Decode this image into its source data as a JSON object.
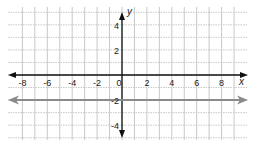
{
  "chart_data": {
    "type": "line",
    "title": "",
    "xlabel": "x",
    "ylabel": "y",
    "xlim": [
      -9,
      9
    ],
    "ylim": [
      -5,
      5
    ],
    "grid": true,
    "x_ticks": [
      -8,
      -6,
      -4,
      -2,
      0,
      2,
      4,
      6,
      8
    ],
    "x_tick_labels": [
      "-8",
      "-6",
      "-4",
      "-2",
      "0",
      "2",
      "4",
      "6",
      "8"
    ],
    "y_ticks": [
      4,
      2,
      -2,
      -4
    ],
    "y_tick_labels": [
      "4",
      "2",
      "-2",
      "-4"
    ],
    "series": [
      {
        "name": "y = -2",
        "kind": "horizontal line with arrows (extends infinitely)",
        "x": [
          -9,
          9
        ],
        "y": [
          -2,
          -2
        ],
        "color": "#8a8a8a"
      }
    ],
    "legend": null
  },
  "colors": {
    "axis": "#111111",
    "grid": "#c8c8c8",
    "line": "#8a8a8a"
  }
}
